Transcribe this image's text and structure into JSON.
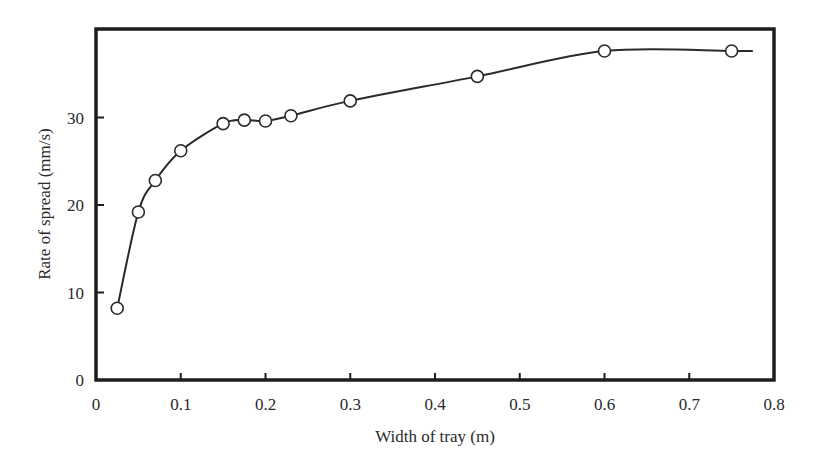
{
  "chart_data": {
    "type": "line",
    "title": "",
    "xlabel": "Width of tray (m)",
    "ylabel": "Rate of spread (mm/s)",
    "xlim": [
      0,
      0.8
    ],
    "ylim": [
      0,
      40
    ],
    "grid": false,
    "legend": null,
    "x_ticks": [
      "0",
      "0.1",
      "0.2",
      "0.3",
      "0.4",
      "0.5",
      "0.6",
      "0.7",
      "0.8"
    ],
    "x_tick_values": [
      0,
      0.1,
      0.2,
      0.3,
      0.4,
      0.5,
      0.6,
      0.7,
      0.8
    ],
    "y_ticks": [
      "0",
      "10",
      "20",
      "30"
    ],
    "y_tick_values": [
      0,
      10,
      20,
      30
    ],
    "series": [
      {
        "name": "Rate of spread",
        "marker": "open-circle",
        "x": [
          0.025,
          0.05,
          0.07,
          0.1,
          0.15,
          0.175,
          0.2,
          0.23,
          0.3,
          0.45,
          0.6,
          0.75
        ],
        "y": [
          8.2,
          19.2,
          22.8,
          26.2,
          29.3,
          29.7,
          29.6,
          30.2,
          31.9,
          34.7,
          37.6,
          37.6
        ],
        "line_extends_to_x": 0.775
      }
    ]
  },
  "colors": {
    "axis": "#1e1e1e",
    "line": "#2a2a2a",
    "marker_fill": "#ffffff",
    "background": "#ffffff"
  }
}
